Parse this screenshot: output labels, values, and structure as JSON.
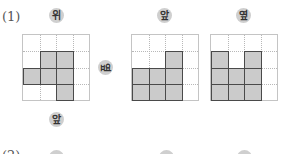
{
  "problems": [
    {
      "number": "(1)",
      "labels": {
        "top": "위",
        "side": "옆",
        "front": "앞"
      },
      "views": [
        {
          "name": "top-view",
          "label": "위",
          "rows": 4,
          "cols": 4,
          "shaded": [
            [
              1,
              1
            ],
            [
              1,
              2
            ],
            [
              2,
              0
            ],
            [
              2,
              1
            ],
            [
              2,
              2
            ],
            [
              3,
              2
            ]
          ]
        },
        {
          "name": "front-view",
          "label": "앞",
          "rows": 4,
          "cols": 4,
          "shaded": [
            [
              1,
              2
            ],
            [
              2,
              0
            ],
            [
              2,
              1
            ],
            [
              2,
              2
            ],
            [
              3,
              0
            ],
            [
              3,
              1
            ],
            [
              3,
              2
            ]
          ]
        },
        {
          "name": "side-view",
          "label": "옆",
          "rows": 4,
          "cols": 4,
          "shaded": [
            [
              1,
              0
            ],
            [
              1,
              2
            ],
            [
              2,
              0
            ],
            [
              2,
              1
            ],
            [
              2,
              2
            ],
            [
              3,
              0
            ],
            [
              3,
              1
            ],
            [
              3,
              2
            ]
          ]
        }
      ]
    },
    {
      "number": "(2)"
    }
  ],
  "colors": {
    "shade": "#cbcbcb",
    "badge": "#cfcfcf",
    "grid_line": "#b8b8b8",
    "shade_border": "#4a4a4a"
  }
}
